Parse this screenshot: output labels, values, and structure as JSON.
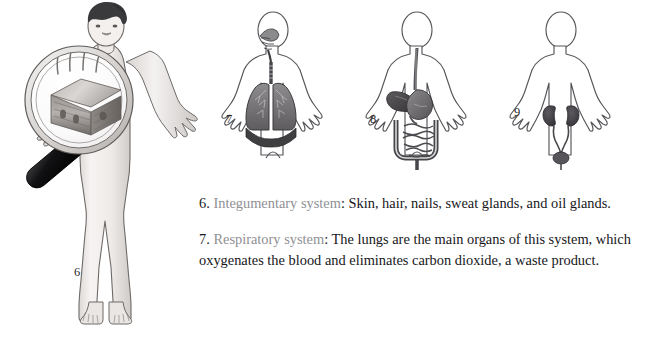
{
  "page": {
    "background": "#ffffff",
    "width": 650,
    "height": 340
  },
  "figures": [
    {
      "number": "6",
      "name": "integumentary-system-figure",
      "caption_key": "integumentary",
      "description": "Full-color standing human figure with dark hair, arms out, a large magnifying glass held over the torso revealing a magnified block of skin cross-section with hairs",
      "highlight_organ": "skin"
    },
    {
      "number": "7",
      "name": "respiratory-system-figure",
      "description": "Human body outline showing nasal cavity, trachea, two lungs and diaphragm",
      "highlight_organ": "lungs"
    },
    {
      "number": "8",
      "name": "digestive-system-figure",
      "description": "Human body outline showing esophagus, stomach, liver, small and large intestines",
      "highlight_organ": "stomach-and-intestines"
    },
    {
      "number": "9",
      "name": "urinary-system-figure",
      "description": "Human body outline showing two kidneys, ureters and bladder",
      "highlight_organ": "kidneys"
    }
  ],
  "paragraphs": [
    {
      "num": "6.",
      "system": "Integumentary system",
      "separator": ":",
      "body": "Skin, hair, nails, sweat glands, and oil glands."
    },
    {
      "num": "7.",
      "system": "Respiratory system",
      "separator": ":",
      "body": "The lungs are the main organs of this system, which oxygenates the blood and eliminates carbon dioxide, a waste product."
    }
  ],
  "colors": {
    "system_name": "#8f9094",
    "body_text": "#17171a",
    "figure_number": "#2b2b2b",
    "skin_fill": "#f2efed",
    "hair_fill": "#3a3a3c",
    "outline": "#4a4a4d",
    "organ_dark": "#4e4e52"
  }
}
